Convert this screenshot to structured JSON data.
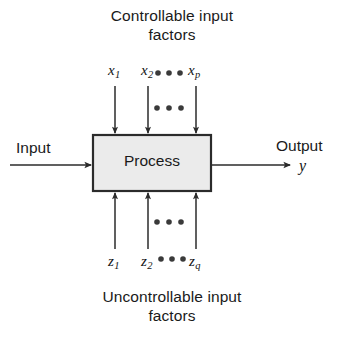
{
  "figure": {
    "type": "process-diagram",
    "captions": {
      "top_line1": "Controllable input",
      "top_line2": "factors",
      "bottom_line1": "Uncontrollable input",
      "bottom_line2": "factors"
    },
    "process_box": {
      "label": "Process",
      "fill_color": "#ebebeb",
      "border_color": "#2b2b2b",
      "x": 92,
      "y": 134,
      "width": 120,
      "height": 58
    },
    "input": {
      "label": "Input",
      "arrow_from_x": 10,
      "arrow_to_x": 92,
      "arrow_y": 165
    },
    "output": {
      "label": "Output",
      "variable": "y",
      "arrow_from_x": 212,
      "arrow_to_x": 290,
      "arrow_y": 165
    },
    "controllable_factors": {
      "labels": [
        {
          "base": "x",
          "sub": "1",
          "x": 115
        },
        {
          "base": "x",
          "sub": "2",
          "x": 148
        },
        {
          "base": "x",
          "sub": "p",
          "x": 196
        }
      ],
      "ellipsis_label": "• • •",
      "ellipsis_mid": "• • •",
      "arrow_direction": "down",
      "arrow_top_y": 85,
      "arrow_bottom_y": 134
    },
    "uncontrollable_factors": {
      "labels": [
        {
          "base": "z",
          "sub": "1",
          "x": 115
        },
        {
          "base": "z",
          "sub": "2",
          "x": 148
        },
        {
          "base": "z",
          "sub": "q",
          "x": 196
        }
      ],
      "ellipsis_label": "• • •",
      "ellipsis_mid": "• • •",
      "arrow_direction": "up",
      "arrow_top_y": 192,
      "arrow_bottom_y": 249
    },
    "colors": {
      "stroke": "#2b2b2b",
      "text": "#1a1a1a",
      "box_fill": "#ebebeb",
      "background": "#ffffff"
    }
  }
}
